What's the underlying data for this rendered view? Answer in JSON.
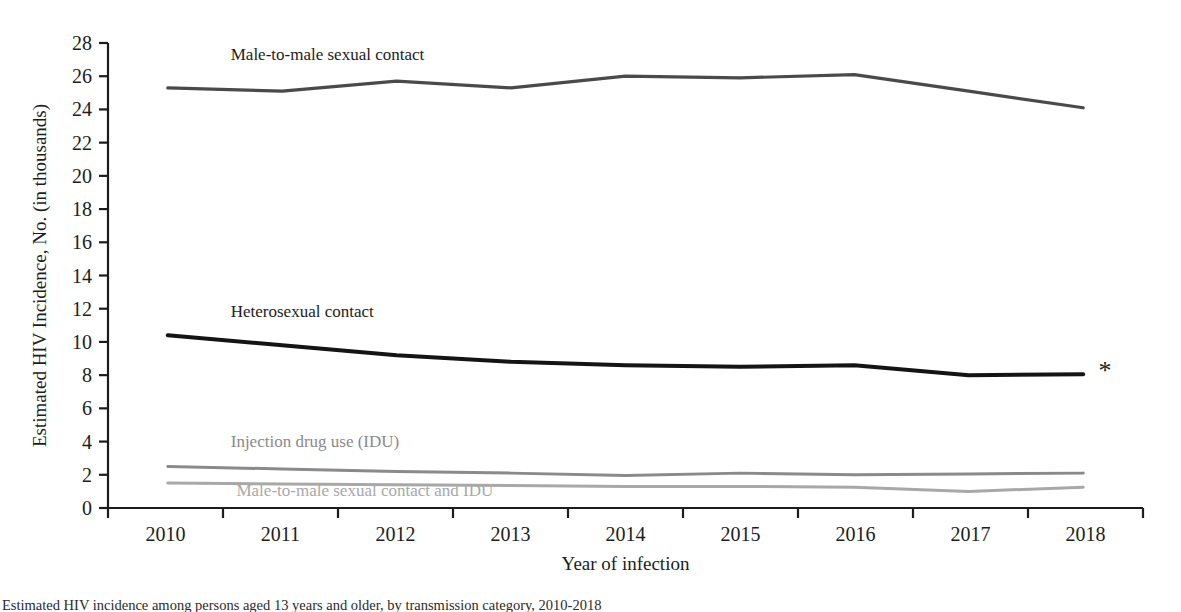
{
  "figure": {
    "background_color": "#ffffff",
    "caption_partial": "Estimated HIV incidence among persons aged 13 years and older, by transmission category, 2010-2018"
  },
  "axes": {
    "x": {
      "title": "Year of infection",
      "tick_labels": [
        "2010",
        "2011",
        "2012",
        "2013",
        "2014",
        "2015",
        "2016",
        "2017",
        "2018"
      ],
      "axis_color": "#1c1c1c"
    },
    "y": {
      "title": "Estimated HIV Incidence, No. (in thousands)",
      "tick_labels": [
        "0",
        "2",
        "4",
        "6",
        "8",
        "10",
        "12",
        "14",
        "16",
        "18",
        "20",
        "22",
        "24",
        "26",
        "28"
      ],
      "axis_color": "#1c1c1c"
    }
  },
  "annotations": {
    "footnote_marker": "*"
  },
  "series_labels": {
    "msm": "Male-to-male sexual contact",
    "het": "Heterosexual contact",
    "idu": "Injection drug use (IDU)",
    "msm_idu": "Male-to-male sexual contact and IDU"
  },
  "chart_data": {
    "type": "line",
    "title": "",
    "xlabel": "Year of infection",
    "ylabel": "Estimated HIV Incidence, No. (in thousands)",
    "x": [
      2010,
      2011,
      2012,
      2013,
      2014,
      2015,
      2016,
      2017,
      2018
    ],
    "xlim": [
      2010,
      2018
    ],
    "ylim": [
      0,
      28
    ],
    "ytick_step": 2,
    "grid": false,
    "legend_position": "inline-labels",
    "series": [
      {
        "name": "Male-to-male sexual contact",
        "color": "#4a4a4a",
        "line_width": 3.2,
        "values": [
          25.3,
          25.1,
          25.7,
          25.3,
          26.0,
          25.9,
          26.1,
          25.1,
          24.1
        ],
        "label_x": 2010.55,
        "label_y": 27.0
      },
      {
        "name": "Heterosexual contact",
        "color": "#141414",
        "line_width": 4.0,
        "values": [
          10.4,
          9.8,
          9.2,
          8.8,
          8.6,
          8.5,
          8.6,
          8.0,
          8.05
        ],
        "label_x": 2010.55,
        "label_y": 11.5
      },
      {
        "name": "Injection drug use (IDU)",
        "color": "#8a8a8a",
        "line_width": 3.0,
        "values": [
          2.5,
          2.35,
          2.2,
          2.1,
          1.95,
          2.1,
          2.0,
          2.05,
          2.1
        ],
        "label_x": 2010.55,
        "label_y": 3.7
      },
      {
        "name": "Male-to-male sexual contact and IDU",
        "color": "#a8a8a8",
        "line_width": 3.0,
        "values": [
          1.5,
          1.45,
          1.4,
          1.35,
          1.3,
          1.3,
          1.25,
          1.0,
          1.25
        ],
        "label_x": 2010.6,
        "label_y": 0.75
      }
    ]
  }
}
